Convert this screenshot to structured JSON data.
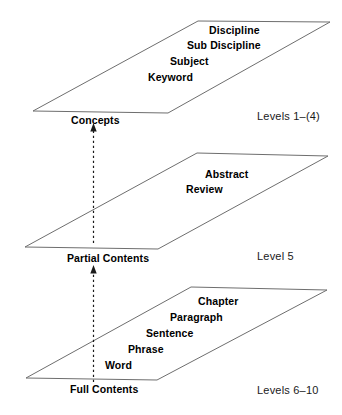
{
  "diagram": {
    "stroke_color": "#6e6e6e",
    "text_color": "#000000",
    "arrow_color": "#1a1a1a",
    "background": "#ffffff",
    "planes": [
      {
        "id": "concepts-plane",
        "base_label": "Concepts",
        "level_label": "Levels 1–(4)",
        "items": [
          "Discipline",
          "Sub Discipline",
          "Subject",
          "Keyword"
        ]
      },
      {
        "id": "partial-contents-plane",
        "base_label": "Partial Contents",
        "level_label": "Level 5",
        "items": [
          "Abstract",
          "Review"
        ]
      },
      {
        "id": "full-contents-plane",
        "base_label": "Full Contents",
        "level_label": "Levels 6–10",
        "items": [
          "Chapter",
          "Paragraph",
          "Sentence",
          "Phrase",
          "Word"
        ]
      }
    ],
    "arrows": [
      {
        "id": "arrow-partial-to-concepts",
        "direction": "up"
      },
      {
        "id": "arrow-full-to-partial",
        "direction": "up"
      }
    ]
  }
}
